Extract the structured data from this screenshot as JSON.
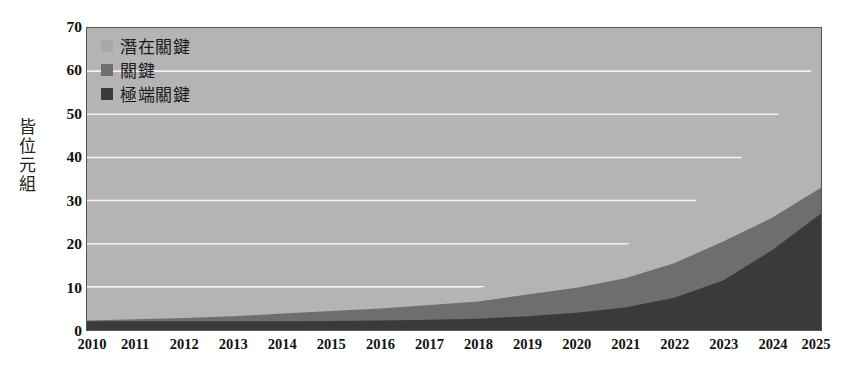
{
  "chart_data": {
    "type": "area",
    "title": "",
    "subtitle": "",
    "xlabel": "",
    "ylabel": "皆位元組",
    "stacked": true,
    "grid": true,
    "legend_position": "top-left",
    "xlim": [
      2010,
      2025
    ],
    "ylim": [
      0,
      70
    ],
    "ytick_step": 10,
    "categories": [
      "2010",
      "2011",
      "2012",
      "2013",
      "2014",
      "2015",
      "2016",
      "2017",
      "2018",
      "2019",
      "2020",
      "2021",
      "2022",
      "2023",
      "2024",
      "2025"
    ],
    "x": [
      2010,
      2011,
      2012,
      2013,
      2014,
      2015,
      2016,
      2017,
      2018,
      2019,
      2020,
      2021,
      2022,
      2023,
      2024,
      2025
    ],
    "yticks": [
      0,
      10,
      20,
      30,
      40,
      50,
      60,
      70
    ],
    "series": [
      {
        "name": "潛在關鍵",
        "color": "#b4b4b4",
        "values": [
          2.6,
          3.1,
          3.6,
          4.3,
          5.2,
          6.2,
          7.2,
          8.3,
          9.6,
          13.5,
          16.0,
          19.5,
          26.0,
          35.0,
          48.0,
          63.0
        ]
      },
      {
        "name": "關鍵",
        "color": "#6e6e6e",
        "values": [
          2.2,
          2.5,
          2.8,
          3.2,
          3.8,
          4.4,
          5.0,
          5.8,
          6.6,
          8.2,
          9.8,
          12.0,
          15.5,
          20.5,
          26.0,
          33.0
        ]
      },
      {
        "name": "極端關鍵",
        "color": "#3a3a3a",
        "values": [
          2.0,
          2.0,
          2.0,
          2.0,
          2.0,
          2.1,
          2.2,
          2.4,
          2.6,
          3.2,
          4.0,
          5.2,
          7.5,
          11.5,
          18.5,
          27.0
        ]
      }
    ]
  },
  "legend": {
    "entries": [
      {
        "label": "潛在關鍵",
        "color": "#a8a8a8"
      },
      {
        "label": "關鍵",
        "color": "#6e6e6e"
      },
      {
        "label": "極端關鍵",
        "color": "#3a3a3a"
      }
    ]
  },
  "axes": {
    "y_title_chars": [
      "皆",
      "位",
      "元",
      "組"
    ],
    "y_tick_labels": [
      "70",
      "60",
      "50",
      "40",
      "30",
      "20",
      "10",
      "0"
    ],
    "x_tick_labels": [
      "2010",
      "2011",
      "2012",
      "2013",
      "2014",
      "2015",
      "2016",
      "2017",
      "2018",
      "2019",
      "2020",
      "2021",
      "2022",
      "2023",
      "2024",
      "2025"
    ]
  },
  "style": {
    "plot_background": "#b4b4b4",
    "gridline_color": "#f2f2f2",
    "frame_color": "#555555",
    "text_color": "#111111"
  }
}
